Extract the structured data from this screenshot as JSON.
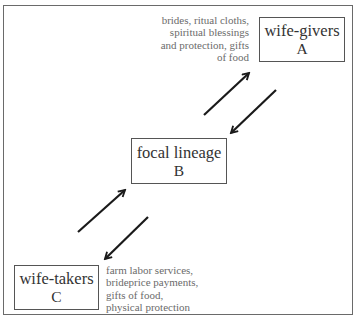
{
  "diagram": {
    "type": "exchange-flow",
    "nodes": {
      "a": {
        "name": "wife-givers",
        "letter": "A"
      },
      "b": {
        "name": "focal lineage",
        "letter": "B"
      },
      "c": {
        "name": "wife-takers",
        "letter": "C"
      }
    },
    "flows": {
      "from_a": {
        "lines": [
          "brides, ritual cloths,",
          "spiritual blessings",
          "and protection, gifts",
          "of food"
        ]
      },
      "from_c": {
        "lines": [
          "farm labor services,",
          "brideprice payments,",
          "gifts of food,",
          "physical protection"
        ]
      }
    },
    "edges": [
      {
        "from": "B",
        "to": "A",
        "direction": "up-right"
      },
      {
        "from": "A",
        "to": "B",
        "direction": "down-left"
      },
      {
        "from": "C",
        "to": "B",
        "direction": "up-right"
      },
      {
        "from": "B",
        "to": "C",
        "direction": "down-left"
      }
    ]
  }
}
